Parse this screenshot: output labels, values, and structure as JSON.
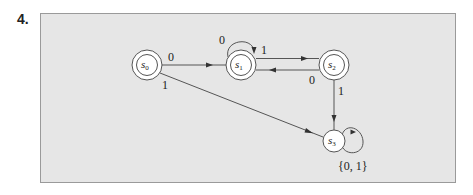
{
  "problem": {
    "number": "4."
  },
  "diagram": {
    "type": "finite-state-automaton",
    "states": [
      {
        "id": "s0",
        "base": "s",
        "sub": "0",
        "final": true,
        "start": true
      },
      {
        "id": "s1",
        "base": "s",
        "sub": "1",
        "final": true
      },
      {
        "id": "s2",
        "base": "s",
        "sub": "2",
        "final": true
      },
      {
        "id": "s3",
        "base": "s",
        "sub": "3",
        "final": false
      }
    ],
    "transitions": [
      {
        "from": "s0",
        "to": "s1",
        "label": "0"
      },
      {
        "from": "s0",
        "to": "s3",
        "label": "1"
      },
      {
        "from": "s1",
        "to": "s1",
        "label": "0"
      },
      {
        "from": "s1",
        "to": "s2",
        "label": "1"
      },
      {
        "from": "s2",
        "to": "s1",
        "label": "0"
      },
      {
        "from": "s2",
        "to": "s3",
        "label": "1"
      },
      {
        "from": "s3",
        "to": "s3",
        "label": "{0, 1}"
      }
    ],
    "colors": {
      "background": "#e6e6e6",
      "stroke": "#555555",
      "state_fill": "#ffffff",
      "border": "#9a9a9a"
    }
  }
}
